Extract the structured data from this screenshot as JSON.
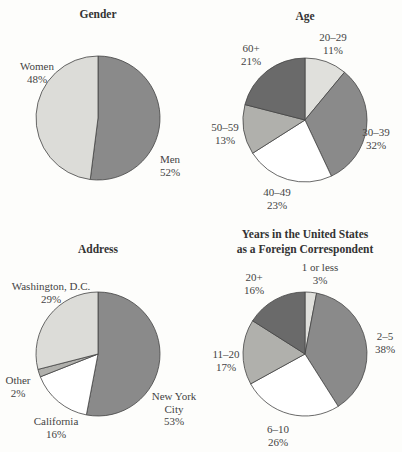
{
  "chart_data": [
    {
      "type": "pie",
      "title": "Gender",
      "center": [
        98,
        118
      ],
      "radius": 62,
      "start_angle": 0,
      "slices": [
        {
          "label": "Men",
          "value": 52,
          "color": "#8a8a8a"
        },
        {
          "label": "Women",
          "value": 48,
          "color": "#dcdcd8"
        }
      ]
    },
    {
      "type": "pie",
      "title": "Age",
      "center": [
        305,
        120
      ],
      "radius": 62,
      "start_angle": 0,
      "slices": [
        {
          "label": "20–29",
          "value": 11,
          "color": "#e0e0dc"
        },
        {
          "label": "30–39",
          "value": 32,
          "color": "#8a8a8a"
        },
        {
          "label": "40–49",
          "value": 23,
          "color": "#ffffff"
        },
        {
          "label": "50–59",
          "value": 13,
          "color": "#b0b0ac"
        },
        {
          "label": "60+",
          "value": 21,
          "color": "#6a6a6a"
        }
      ]
    },
    {
      "type": "pie",
      "title": "Address",
      "center": [
        98,
        354
      ],
      "radius": 62,
      "start_angle": 0,
      "slices": [
        {
          "label": "New York City",
          "value": 53,
          "color": "#8a8a8a"
        },
        {
          "label": "California",
          "value": 16,
          "color": "#ffffff"
        },
        {
          "label": "Other",
          "value": 2,
          "color": "#b0b0ac"
        },
        {
          "label": "Washington, D.C.",
          "value": 29,
          "color": "#dcdcd8"
        }
      ]
    },
    {
      "type": "pie",
      "title": "Years in the United States as a Foreign Correspondent",
      "center": [
        305,
        354
      ],
      "radius": 62,
      "start_angle": 0,
      "slices": [
        {
          "label": "1 or less",
          "value": 3,
          "color": "#e0e0dc"
        },
        {
          "label": "2–5",
          "value": 38,
          "color": "#8a8a8a"
        },
        {
          "label": "6–10",
          "value": 26,
          "color": "#ffffff"
        },
        {
          "label": "11–20",
          "value": 17,
          "color": "#b0b0ac"
        },
        {
          "label": "20+",
          "value": 16,
          "color": "#6a6a6a"
        }
      ]
    }
  ],
  "titles": {
    "gender": "Gender",
    "age": "Age",
    "address": "Address",
    "years_line1": "Years in the United States",
    "years_line2": "as a Foreign Correspondent"
  },
  "labels": {
    "gender": [
      {
        "name": "Women",
        "pct": "48%",
        "x": 37,
        "y": 70
      },
      {
        "name": "Men",
        "pct": "52%",
        "x": 170,
        "y": 163
      }
    ],
    "age": [
      {
        "name": "20–29",
        "pct": "11%",
        "x": 333,
        "y": 41
      },
      {
        "name": "30–39",
        "pct": "32%",
        "x": 376,
        "y": 136
      },
      {
        "name": "40–49",
        "pct": "23%",
        "x": 277,
        "y": 196
      },
      {
        "name": "50–59",
        "pct": "13%",
        "x": 225,
        "y": 131
      },
      {
        "name": "60+",
        "pct": "21%",
        "x": 251,
        "y": 52
      }
    ],
    "address": [
      {
        "name": "Washington, D.C.",
        "pct": "29%",
        "x": 51,
        "y": 290
      },
      {
        "name": "Other",
        "pct": "2%",
        "x": 18,
        "y": 384
      },
      {
        "name": "California",
        "pct": "16%",
        "x": 56,
        "y": 425
      },
      {
        "name": "New York",
        "name2": "City",
        "pct": "53%",
        "x": 174,
        "y": 400
      }
    ],
    "years": [
      {
        "name": "1 or less",
        "pct": "3%",
        "x": 320,
        "y": 271
      },
      {
        "name": "2–5",
        "pct": "38%",
        "x": 385,
        "y": 340
      },
      {
        "name": "6–10",
        "pct": "26%",
        "x": 278,
        "y": 433
      },
      {
        "name": "11–20",
        "pct": "17%",
        "x": 226,
        "y": 358
      },
      {
        "name": "20+",
        "pct": "16%",
        "x": 254,
        "y": 281
      }
    ]
  }
}
